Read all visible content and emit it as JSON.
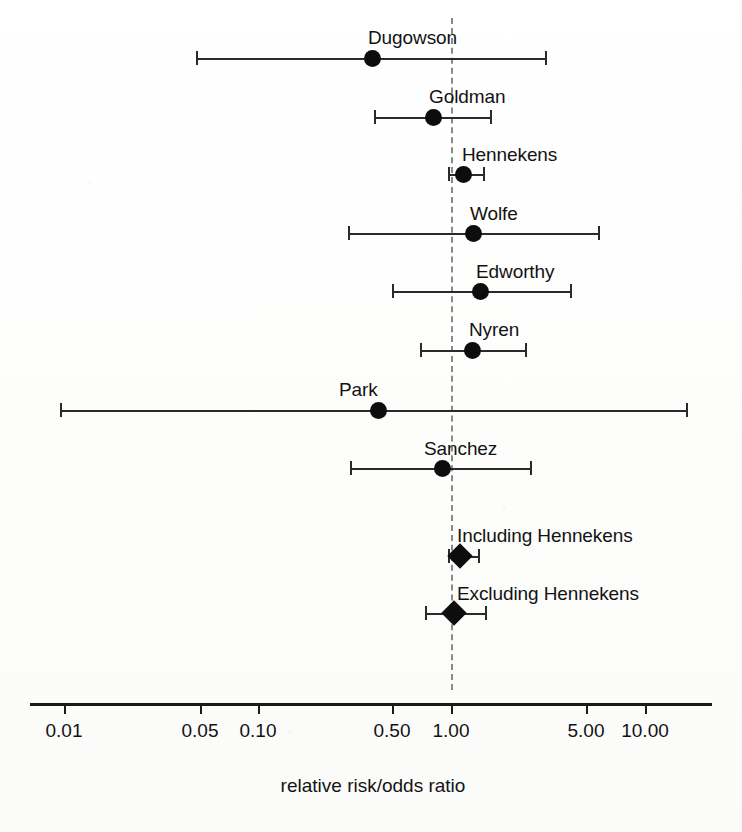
{
  "chart_data": {
    "type": "scatter",
    "subtype": "forest-plot",
    "title": "",
    "xlabel": "relative risk/odds ratio",
    "ylabel": "",
    "scale": "log",
    "xlim": [
      0.0085,
      16.5
    ],
    "grid": false,
    "legend": "none",
    "reference_line": {
      "value": 1.0,
      "style": "dashed",
      "color": "#8a8a8a"
    },
    "xticks": [
      {
        "label": "0.01",
        "value": 0.01,
        "px": 64
      },
      {
        "label": "0.05",
        "value": 0.05,
        "px": 200
      },
      {
        "label": "0.10",
        "value": 0.1,
        "px": 258
      },
      {
        "label": "0.50",
        "value": 0.5,
        "px": 392
      },
      {
        "label": "1.00",
        "value": 1.0,
        "px": 451
      },
      {
        "label": "5.00",
        "value": 5.0,
        "px": 586
      },
      {
        "label": "10.00",
        "value": 10.0,
        "px": 645
      }
    ],
    "axis": {
      "line_y_px": 703,
      "line_left_px": 30,
      "line_right_px": 712,
      "tick_length_px": 11,
      "tick_label_y_px": 721,
      "title_y_px": 776,
      "title_center_px": 373
    },
    "rows": [
      {
        "label": "Dugowson",
        "marker": "circle",
        "estimate": 0.42,
        "ci_low": 0.068,
        "ci_high": 2.82,
        "y_px": 58,
        "est_px": 372,
        "low_px": 196,
        "high_px": 545,
        "label_x_px": 368,
        "label_y_px": 28
      },
      {
        "label": "Goldman",
        "marker": "circle",
        "estimate": 0.81,
        "ci_low": 0.41,
        "ci_high": 1.62,
        "y_px": 117,
        "est_px": 433,
        "low_px": 374,
        "high_px": 490,
        "label_x_px": 429,
        "label_y_px": 87
      },
      {
        "label": "Hennekens",
        "marker": "circle",
        "estimate": 1.15,
        "ci_low": 0.97,
        "ci_high": 1.42,
        "y_px": 174,
        "est_px": 463,
        "low_px": 448,
        "high_px": 483,
        "label_x_px": 462,
        "label_y_px": 145
      },
      {
        "label": "Wolfe",
        "marker": "circle",
        "estimate": 1.29,
        "ci_low": 0.33,
        "ci_high": 5.02,
        "y_px": 233,
        "est_px": 473,
        "low_px": 348,
        "high_px": 598,
        "label_x_px": 470,
        "label_y_px": 204
      },
      {
        "label": "Edworthy",
        "marker": "circle",
        "estimate": 1.38,
        "ci_low": 0.5,
        "ci_high": 3.8,
        "y_px": 291,
        "est_px": 480,
        "low_px": 392,
        "high_px": 570,
        "label_x_px": 476,
        "label_y_px": 262
      },
      {
        "label": "Nyren",
        "marker": "circle",
        "estimate": 1.28,
        "ci_low": 0.69,
        "ci_high": 2.3,
        "y_px": 350,
        "est_px": 472,
        "low_px": 420,
        "high_px": 525,
        "label_x_px": 469,
        "label_y_px": 320
      },
      {
        "label": "Park",
        "marker": "circle",
        "estimate": 0.44,
        "ci_low": 0.0095,
        "ci_high": 13.2,
        "y_px": 410,
        "est_px": 378,
        "low_px": 60,
        "high_px": 686,
        "label_x_px": 339,
        "label_y_px": 380
      },
      {
        "label": "Sanchez",
        "marker": "circle",
        "estimate": 0.9,
        "ci_low": 0.36,
        "ci_high": 2.45,
        "y_px": 468,
        "est_px": 442,
        "low_px": 350,
        "high_px": 530,
        "label_x_px": 424,
        "label_y_px": 439
      },
      {
        "label": "Including Hennekens",
        "marker": "diamond",
        "estimate": 1.11,
        "ci_low": 0.97,
        "ci_high": 1.36,
        "y_px": 556,
        "est_px": 460,
        "low_px": 448,
        "high_px": 478,
        "label_x_px": 457,
        "label_y_px": 526
      },
      {
        "label": "Excluding Hennekens",
        "marker": "diamond",
        "estimate": 1.04,
        "ci_low": 0.74,
        "ci_high": 1.47,
        "y_px": 613,
        "est_px": 454,
        "low_px": 425,
        "high_px": 485,
        "label_x_px": 457,
        "label_y_px": 584
      }
    ]
  },
  "colors": {
    "marker": "#0d0d0d",
    "line": "#2a2a2a",
    "axis": "#1a1a1a",
    "reference": "#8a8a8a",
    "background": "#fefefe",
    "text": "#131313"
  }
}
